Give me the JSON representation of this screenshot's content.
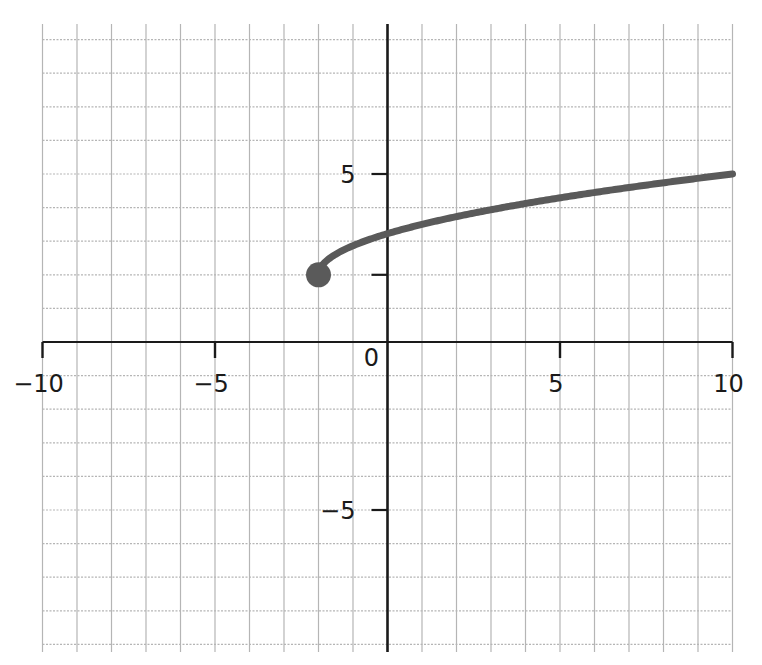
{
  "chart_data": {
    "type": "line",
    "title": "",
    "xlabel": "",
    "ylabel": "",
    "xlim": [
      -10,
      10
    ],
    "ylim": [
      -9.3,
      9.5
    ],
    "grid": true,
    "grid_step": 1,
    "x_ticks": [
      {
        "value": -10,
        "label": "−10"
      },
      {
        "value": -5,
        "label": "−5"
      },
      {
        "value": 5,
        "label": "5"
      },
      {
        "value": 10,
        "label": "10"
      }
    ],
    "y_ticks": [
      {
        "value": 5,
        "label": "5"
      },
      {
        "value": 2,
        "label": ""
      },
      {
        "value": -5,
        "label": "−5"
      }
    ],
    "origin_label": "0",
    "series": [
      {
        "name": "curve",
        "function": "y = 2 + sqrt(0.75*(x + 2))",
        "domain": [
          -2,
          10
        ],
        "x": [
          -2,
          -1,
          0,
          1,
          2,
          3,
          4,
          5,
          6,
          7,
          8,
          9,
          10
        ],
        "y": [
          2,
          2.87,
          3.22,
          3.5,
          3.73,
          3.94,
          4.12,
          4.29,
          4.45,
          4.6,
          4.74,
          4.87,
          5
        ],
        "start_point": {
          "x": -2,
          "y": 2,
          "closed": true
        },
        "color": "#5a5a5a"
      }
    ],
    "colors": {
      "axis": "#1a1a1a",
      "grid": "#b5b5b5",
      "curve": "#5a5a5a"
    }
  }
}
